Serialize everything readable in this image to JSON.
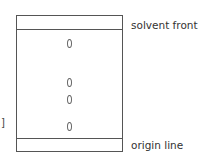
{
  "diagram": {
    "type": "thin-layer chromatography plate",
    "labels": {
      "solvent_front": "solvent front",
      "origin_line": "origin line",
      "bracket": "]"
    },
    "spots": [
      {
        "y": 44
      },
      {
        "y": 82
      },
      {
        "y": 99
      },
      {
        "y": 126
      }
    ]
  }
}
